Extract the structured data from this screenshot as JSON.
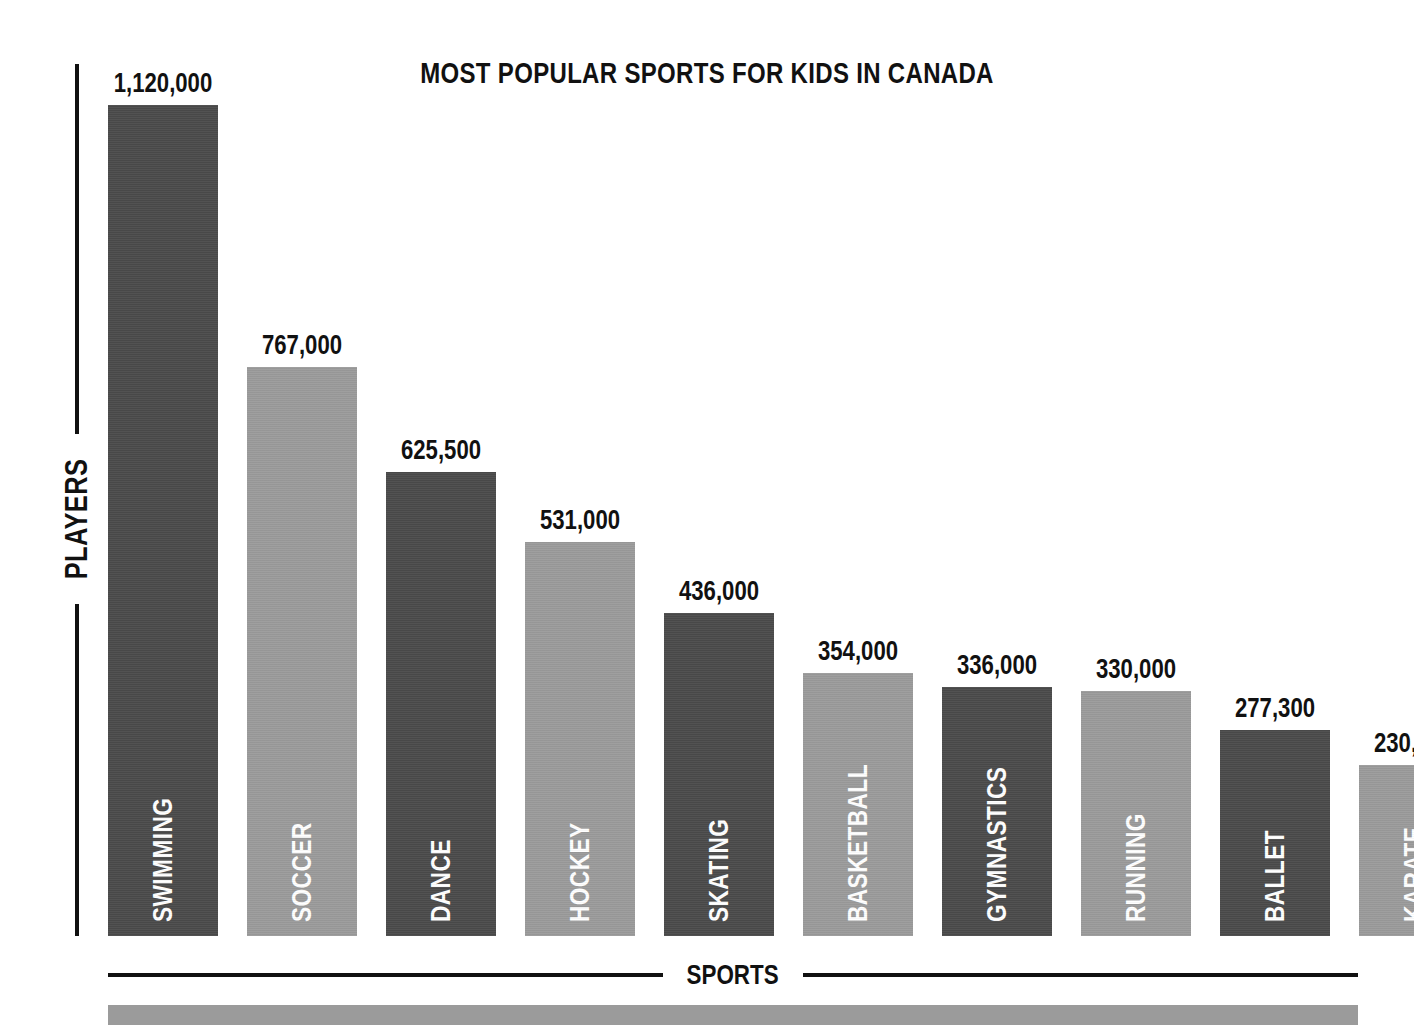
{
  "chart_data": {
    "type": "bar",
    "title": "MOST POPULAR SPORTS FOR KIDS IN CANADA",
    "xlabel": "SPORTS",
    "ylabel": "PLAYERS",
    "grid": false,
    "legend": "none",
    "ylim": [
      0,
      1120000
    ],
    "categories": [
      "SWIMMING",
      "SOCCER",
      "DANCE",
      "HOCKEY",
      "SKATING",
      "BASKETBALL",
      "GYMNASTICS",
      "RUNNING",
      "BALLET",
      "KARATE"
    ],
    "values": [
      1120000,
      767000,
      625500,
      531000,
      436000,
      354000,
      336000,
      330000,
      277300,
      230000
    ],
    "value_labels": [
      "1,120,000",
      "767,000",
      "625,500",
      "531,000",
      "436,000",
      "354,000",
      "336,000",
      "330,000",
      "277,300",
      "230,000"
    ],
    "bar_colors": [
      "#4a4a4a",
      "#9b9b9b",
      "#4a4a4a",
      "#9b9b9b",
      "#4a4a4a",
      "#9b9b9b",
      "#4a4a4a",
      "#9b9b9b",
      "#4a4a4a",
      "#9b9b9b"
    ],
    "bars": [
      {
        "category": "SWIMMING",
        "value": 1120000,
        "label": "1,120,000",
        "shade": "dark"
      },
      {
        "category": "SOCCER",
        "value": 767000,
        "label": "767,000",
        "shade": "light"
      },
      {
        "category": "DANCE",
        "value": 625500,
        "label": "625,500",
        "shade": "dark"
      },
      {
        "category": "HOCKEY",
        "value": 531000,
        "label": "531,000",
        "shade": "light"
      },
      {
        "category": "SKATING",
        "value": 436000,
        "label": "436,000",
        "shade": "dark"
      },
      {
        "category": "BASKETBALL",
        "value": 354000,
        "label": "354,000",
        "shade": "light"
      },
      {
        "category": "GYMNASTICS",
        "value": 336000,
        "label": "336,000",
        "shade": "dark"
      },
      {
        "category": "RUNNING",
        "value": 330000,
        "label": "330,000",
        "shade": "light"
      },
      {
        "category": "BALLET",
        "value": 277300,
        "label": "277,300",
        "shade": "dark"
      },
      {
        "category": "KARATE",
        "value": 230000,
        "label": "230,000",
        "shade": "light"
      }
    ]
  },
  "colors": {
    "dark_bar": "#4a4a4a",
    "light_bar": "#9b9b9b",
    "ink": "#111111",
    "background": "#ffffff",
    "label_text": "#ffffff"
  },
  "layout": {
    "first_bar_left": 108,
    "bar_width": 110,
    "bar_pitch": 139,
    "baseline_y": 936,
    "px_per_unit": 0.000742
  }
}
